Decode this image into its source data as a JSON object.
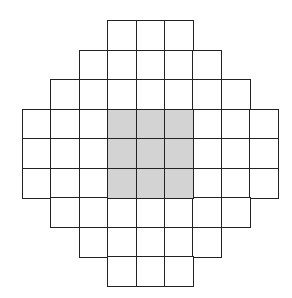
{
  "diagram": {
    "title": "",
    "colors": {
      "line": "#222222",
      "fill_empty": "#ffffff",
      "fill_shaded": "#d3d3d3"
    },
    "origin": {
      "x": 22,
      "y": 20
    },
    "cell_size": {
      "w": 28.4,
      "h": 29.5
    },
    "rows": [
      {
        "row": 0,
        "start_col": 3,
        "end_col": 5
      },
      {
        "row": 1,
        "start_col": 2,
        "end_col": 6
      },
      {
        "row": 2,
        "start_col": 1,
        "end_col": 7
      },
      {
        "row": 3,
        "start_col": 0,
        "end_col": 8
      },
      {
        "row": 4,
        "start_col": 0,
        "end_col": 8
      },
      {
        "row": 5,
        "start_col": 0,
        "end_col": 8
      },
      {
        "row": 6,
        "start_col": 1,
        "end_col": 7
      },
      {
        "row": 7,
        "start_col": 2,
        "end_col": 6
      },
      {
        "row": 8,
        "start_col": 3,
        "end_col": 5
      }
    ],
    "shaded": {
      "rows": [
        3,
        5
      ],
      "cols": [
        3,
        5
      ]
    }
  }
}
